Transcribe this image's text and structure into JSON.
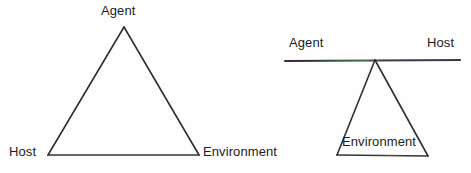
{
  "figure": {
    "background_color": "#fefeff",
    "stroke_color": "#2b2b2b",
    "text_color": "#1c1c1c",
    "diagrams": [
      {
        "id": "left-triangle",
        "name": "agent-host-environment-triangle",
        "shape": "triangle",
        "vertices": {
          "apex": [
            124,
            27
          ],
          "bottom_left": [
            48,
            155
          ],
          "bottom_right": [
            199,
            155
          ]
        },
        "labels": {
          "apex": "Agent",
          "bottom_left": "Host",
          "bottom_right": "Environment"
        }
      },
      {
        "id": "right-balance",
        "name": "agent-host-balance-on-environment",
        "shape": "bar-on-triangle",
        "bar": {
          "x1": 285,
          "y1": 61,
          "x2": 460,
          "y2": 60
        },
        "vertices": {
          "apex": [
            375,
            60
          ],
          "bottom_left": [
            337,
            155
          ],
          "bottom_right": [
            428,
            156
          ]
        },
        "labels": {
          "bar_left": "Agent",
          "bar_right": "Host",
          "triangle_inner": "Environment"
        }
      }
    ]
  }
}
